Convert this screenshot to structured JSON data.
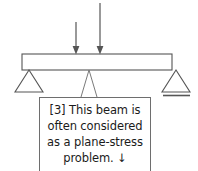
{
  "figure": {
    "background_color": "#ffffff",
    "line_color": "#555555",
    "text_color": "#1b1b1b",
    "box_border_color": "#6e6e6e"
  },
  "beam": {
    "label": "beam",
    "left_x": 22,
    "right_x": 172,
    "top_y": 54,
    "bottom_y": 70
  },
  "loads": [
    {
      "name": "point-load-left",
      "x": 76,
      "top_y": 22,
      "tip_y": 53,
      "direction": "down"
    },
    {
      "name": "point-load-right",
      "x": 100,
      "top_y": 3,
      "tip_y": 53,
      "direction": "down"
    }
  ],
  "supports": [
    {
      "name": "pin-support",
      "type": "pin",
      "x": 29,
      "apex_y": 70,
      "base_y": 92,
      "half_width": 14,
      "has_ground_line": false
    },
    {
      "name": "roller-support",
      "type": "roller",
      "x": 176,
      "apex_y": 70,
      "base_y": 92,
      "half_width": 14,
      "has_ground_line": true
    }
  ],
  "leader": {
    "name": "callout-leader",
    "anchor_x": 89,
    "anchor_y": 70,
    "left_x": 81,
    "right_x": 97,
    "box_y": 97
  },
  "callout": {
    "name": "callout-note",
    "lines": [
      "[3] This beam is",
      "often considered",
      "as a plane-stress",
      "problem.  ↓"
    ],
    "text": "[3] This beam is often considered as a plane-stress problem. ↓"
  }
}
